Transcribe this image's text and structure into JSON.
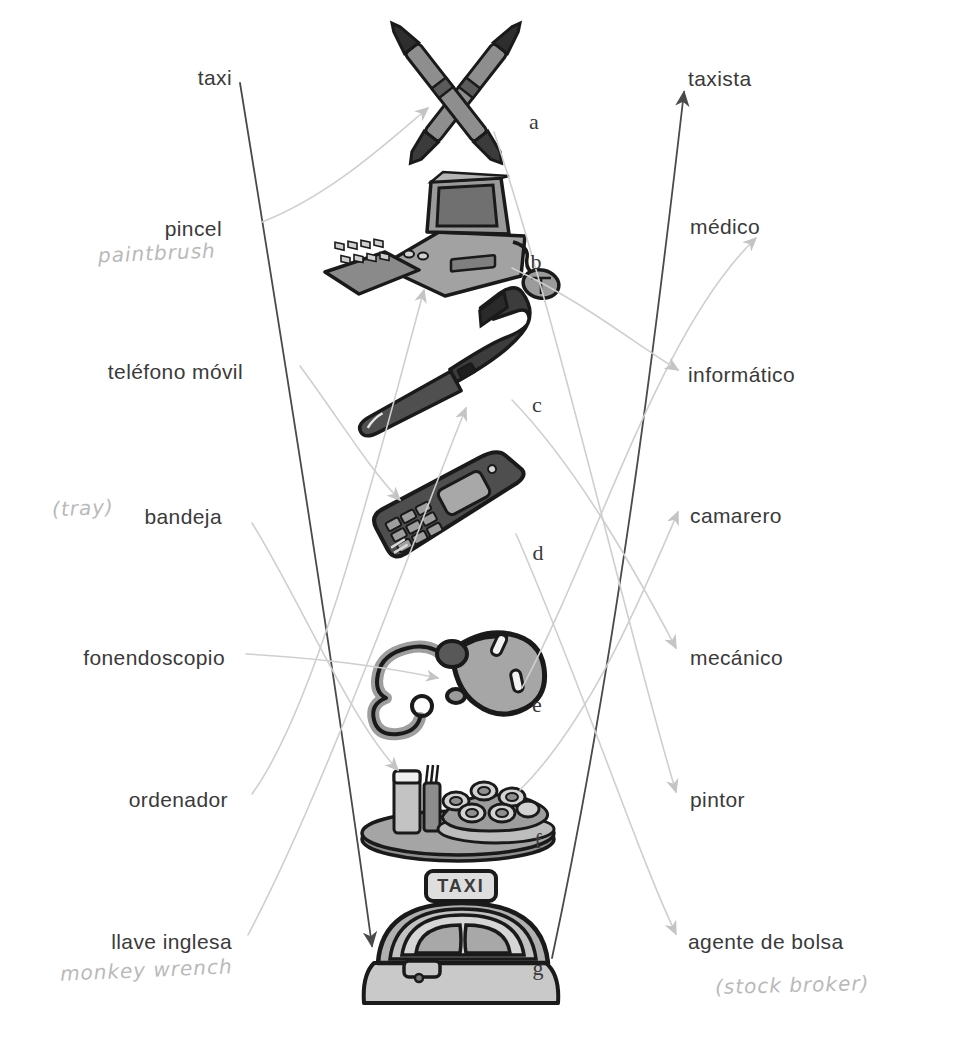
{
  "worksheet": {
    "type": "vocabulary-matching-exercise",
    "left_column_heading": "objetos",
    "right_column_heading": "profesiones",
    "left_labels": [
      {
        "id": "taxi",
        "text": "taxi",
        "x": 232,
        "y": 77,
        "annotation": null
      },
      {
        "id": "pincel",
        "text": "pincel",
        "x": 222,
        "y": 228,
        "annotation": "paintbrush",
        "annotation_x": 98,
        "annotation_y": 251
      },
      {
        "id": "telefono",
        "text": "teléfono móvil",
        "x": 243,
        "y": 371,
        "annotation": null
      },
      {
        "id": "bandeja",
        "text": "bandeja",
        "x": 222,
        "y": 516,
        "annotation": "(tray)",
        "annotation_x": 52,
        "annotation_y": 506
      },
      {
        "id": "fonendoscopio",
        "text": "fonendoscopio",
        "x": 225,
        "y": 657,
        "annotation": null
      },
      {
        "id": "ordenador",
        "text": "ordenador",
        "x": 228,
        "y": 799,
        "annotation": null
      },
      {
        "id": "llave",
        "text": "llave inglesa",
        "x": 232,
        "y": 941,
        "annotation": "monkey wrench",
        "annotation_x": 60,
        "annotation_y": 969
      }
    ],
    "right_labels": [
      {
        "id": "taxista",
        "text": "taxista",
        "x": 688,
        "y": 78,
        "annotation": null
      },
      {
        "id": "medico",
        "text": "médico",
        "x": 690,
        "y": 226,
        "annotation": null
      },
      {
        "id": "informatico",
        "text": "informático",
        "x": 688,
        "y": 374,
        "annotation": null
      },
      {
        "id": "camarero",
        "text": "camarero",
        "x": 690,
        "y": 515,
        "annotation": null
      },
      {
        "id": "mecanico",
        "text": "mecánico",
        "x": 690,
        "y": 657,
        "annotation": null
      },
      {
        "id": "pintor",
        "text": "pintor",
        "x": 690,
        "y": 799,
        "annotation": null
      },
      {
        "id": "agente",
        "text": "agente de bolsa",
        "x": 688,
        "y": 941,
        "annotation": "(stock broker)",
        "annotation_x": 715,
        "annotation_y": 983
      }
    ],
    "pictures": [
      {
        "letter": "a",
        "name": "crossed-paintbrushes",
        "letter_x": 534,
        "letter_y": 122,
        "cx": 456,
        "cy": 105
      },
      {
        "letter": "b",
        "name": "desktop-computer",
        "letter_x": 536,
        "letter_y": 262,
        "cx": 447,
        "cy": 238
      },
      {
        "letter": "c",
        "name": "adjustable-wrench",
        "letter_x": 537,
        "letter_y": 405,
        "cx": 460,
        "cy": 380
      },
      {
        "letter": "d",
        "name": "mobile-phone",
        "letter_x": 538,
        "letter_y": 553,
        "cx": 452,
        "cy": 513
      },
      {
        "letter": "e",
        "name": "stethoscope",
        "letter_x": 537,
        "letter_y": 705,
        "cx": 458,
        "cy": 668
      },
      {
        "letter": "f",
        "name": "food-tray",
        "letter_x": 538,
        "letter_y": 841,
        "cx": 458,
        "cy": 805
      },
      {
        "letter": "g",
        "name": "taxi-car",
        "letter_x": 538,
        "letter_y": 968,
        "cx": 460,
        "cy": 945
      }
    ]
  },
  "colors": {
    "ink_dark": "#4a4a4a",
    "ink_mid": "#9a9a9a",
    "ink_light": "#cfcfcf",
    "text": "#3a3a3a",
    "handwriting": "#b9b9b9",
    "art_fill": "#9b9b9b",
    "art_outline": "#1a1a1a",
    "page": "#ffffff"
  }
}
